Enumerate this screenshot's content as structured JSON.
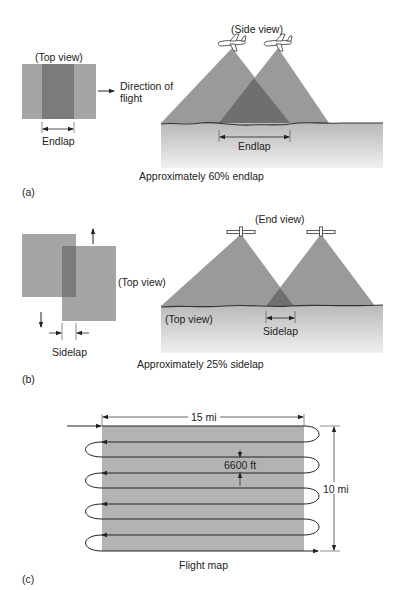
{
  "colors": {
    "photo_light": "#a5a5a5",
    "photo_dark": "#7b7b7b",
    "cone": "#9a9a9a",
    "overlap": "#6f6f6f",
    "ground_top": "#b9b9b9",
    "ground_bottom": "#ececec",
    "line": "#222222",
    "map_fill": "#b3b3b3"
  },
  "panel_a": {
    "label": "(a)",
    "top_view_label": "(Top view)",
    "direction_label_line1": "Direction of",
    "direction_label_line2": "flight",
    "endlap_left_label": "Endlap",
    "side_view_label": "(Side view)",
    "endlap_right_label": "Endlap",
    "caption": "Approximately 60% endlap"
  },
  "panel_b": {
    "label": "(b)",
    "top_view_right_label": "(Top view)",
    "sidelap_left_label": "Sidelap",
    "end_view_label": "(End view)",
    "top_view_ground_label": "(Top view)",
    "sidelap_right_label": "Sidelap",
    "caption": "Approximately 25% sidelap"
  },
  "panel_c": {
    "label": "(c)",
    "width_label": "15 mi",
    "spacing_label": "6600 ft",
    "height_label": "10 mi",
    "caption": "Flight map",
    "flight_lines": 9
  }
}
